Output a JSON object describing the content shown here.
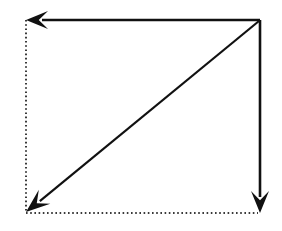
{
  "figure": {
    "title": "Square diagram with three solid arrows and two dotted guide lines",
    "canvas": {
      "width": 282,
      "height": 231,
      "background": "#ffffff"
    },
    "style": {
      "stroke_color": "#111111",
      "dotted_color": "#3a3a3a",
      "solid_stroke_width": 2.6,
      "diagonal_stroke_width": 2.2,
      "dotted_stroke_width": 2.0,
      "dot_pattern": "1.6 2.6"
    },
    "geometry": {
      "left_x": 26,
      "right_x": 260,
      "top_y": 20,
      "bottom_y": 213
    },
    "corners": [
      {
        "name": "top-left",
        "x": 26,
        "y": 20
      },
      {
        "name": "top-right",
        "x": 260,
        "y": 20
      },
      {
        "name": "bottom-left",
        "x": 26,
        "y": 213
      },
      {
        "name": "bottom-right",
        "x": 260,
        "y": 213
      }
    ],
    "lines": [
      {
        "id": "top-arrow",
        "kind": "solid-arrow",
        "label": "top horizontal arrow pointing left",
        "from": {
          "x": 260,
          "y": 20
        },
        "to": {
          "x": 28,
          "y": 20
        },
        "direction": "left",
        "arrowhead": "end"
      },
      {
        "id": "right-arrow",
        "kind": "solid-arrow",
        "label": "right vertical arrow pointing down",
        "from": {
          "x": 260,
          "y": 20
        },
        "to": {
          "x": 260,
          "y": 211
        },
        "direction": "down",
        "arrowhead": "end"
      },
      {
        "id": "diagonal-arrow",
        "kind": "solid-arrow",
        "label": "diagonal arrow from top-right to bottom-left",
        "from": {
          "x": 259,
          "y": 21
        },
        "to": {
          "x": 29,
          "y": 210
        },
        "direction": "down-left",
        "arrowhead": "end"
      },
      {
        "id": "left-dotted",
        "kind": "dotted-line",
        "label": "left vertical dotted guide line",
        "from": {
          "x": 26,
          "y": 20
        },
        "to": {
          "x": 26,
          "y": 213
        },
        "direction": "vertical",
        "arrowhead": "none"
      },
      {
        "id": "bottom-dotted",
        "kind": "dotted-line",
        "label": "bottom horizontal dotted guide line",
        "from": {
          "x": 26,
          "y": 213
        },
        "to": {
          "x": 258,
          "y": 213
        },
        "direction": "horizontal",
        "arrowhead": "none"
      }
    ],
    "arrowheads": [
      {
        "id": "top-left-arrowhead",
        "points_to": "left",
        "tip": {
          "x": 26,
          "y": 20
        },
        "length": 22,
        "half_width": 9
      },
      {
        "id": "bottom-right-arrowhead",
        "points_to": "down",
        "tip": {
          "x": 260,
          "y": 213
        },
        "length": 22,
        "half_width": 9
      },
      {
        "id": "bottom-left-arrowhead",
        "points_to": "down-left",
        "tip": {
          "x": 26,
          "y": 212
        },
        "length": 24,
        "half_width": 9
      }
    ]
  }
}
